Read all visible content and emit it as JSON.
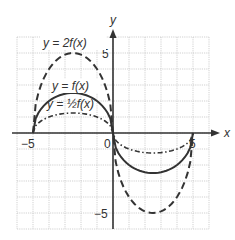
{
  "chart_data": {
    "type": "line",
    "title": "",
    "xlabel": "x",
    "ylabel": "y",
    "xlim": [
      -6,
      6
    ],
    "ylim": [
      -6,
      6
    ],
    "grid": true,
    "x_ticks_labeled": [
      "-5",
      "0",
      "5"
    ],
    "y_ticks_labeled": [
      "5",
      "-5"
    ],
    "series": [
      {
        "name": "y = 2f(x)",
        "style": "dashed",
        "points": [
          [
            -5,
            0
          ],
          [
            -4.5,
            3.0
          ],
          [
            -4,
            4.0
          ],
          [
            -3.5,
            4.6
          ],
          [
            -3,
            4.9
          ],
          [
            -2.5,
            5.0
          ],
          [
            -2,
            4.9
          ],
          [
            -1.5,
            4.6
          ],
          [
            -1,
            4.0
          ],
          [
            -0.5,
            3.0
          ],
          [
            0,
            0
          ],
          [
            0.5,
            -3.0
          ],
          [
            1,
            -4.0
          ],
          [
            1.5,
            -4.6
          ],
          [
            2,
            -4.9
          ],
          [
            2.5,
            -5.0
          ],
          [
            3,
            -4.9
          ],
          [
            3.5,
            -4.6
          ],
          [
            4,
            -4.0
          ],
          [
            4.5,
            -3.0
          ],
          [
            5,
            0
          ]
        ]
      },
      {
        "name": "y = f(x)",
        "style": "solid",
        "points": [
          [
            -5,
            0
          ],
          [
            -4.5,
            1.5
          ],
          [
            -4,
            2.0
          ],
          [
            -3.5,
            2.3
          ],
          [
            -3,
            2.45
          ],
          [
            -2.5,
            2.5
          ],
          [
            -2,
            2.45
          ],
          [
            -1.5,
            2.3
          ],
          [
            -1,
            2.0
          ],
          [
            -0.5,
            1.5
          ],
          [
            0,
            0
          ],
          [
            0.5,
            -1.5
          ],
          [
            1,
            -2.0
          ],
          [
            1.5,
            -2.3
          ],
          [
            2,
            -2.45
          ],
          [
            2.5,
            -2.5
          ],
          [
            3,
            -2.45
          ],
          [
            3.5,
            -2.3
          ],
          [
            4,
            -2.0
          ],
          [
            4.5,
            -1.5
          ],
          [
            5,
            0
          ]
        ]
      },
      {
        "name": "y = ½f(x)",
        "style": "dash-dot",
        "points": [
          [
            -5,
            0
          ],
          [
            -4.5,
            0.75
          ],
          [
            -4,
            1.0
          ],
          [
            -3.5,
            1.15
          ],
          [
            -3,
            1.22
          ],
          [
            -2.5,
            1.25
          ],
          [
            -2,
            1.22
          ],
          [
            -1.5,
            1.15
          ],
          [
            -1,
            1.0
          ],
          [
            -0.5,
            0.75
          ],
          [
            0,
            0
          ],
          [
            0.5,
            -0.75
          ],
          [
            1,
            -1.0
          ],
          [
            1.5,
            -1.15
          ],
          [
            2,
            -1.22
          ],
          [
            2.5,
            -1.25
          ],
          [
            3,
            -1.22
          ],
          [
            3.5,
            -1.15
          ],
          [
            4,
            -1.0
          ],
          [
            4.5,
            -0.75
          ],
          [
            5,
            0
          ]
        ]
      }
    ],
    "annotations": [
      {
        "text": "y = 2f(x)",
        "x": -3.2,
        "y": 5.6
      },
      {
        "text": "y = f(x)",
        "x": -3.2,
        "y": 2.8
      },
      {
        "text": "y = ½f(x)",
        "x": -3.2,
        "y": 1.4
      }
    ]
  },
  "labels": {
    "x_axis": "x",
    "y_axis": "y",
    "tick_neg5_x": "−5",
    "tick_0": "0",
    "tick_5_x": "5",
    "tick_5_y": "5",
    "tick_neg5_y": "−5",
    "ann_2f": "y = 2f(x)",
    "ann_f": "y = f(x)",
    "ann_half_f": "y = ½f(x)"
  }
}
